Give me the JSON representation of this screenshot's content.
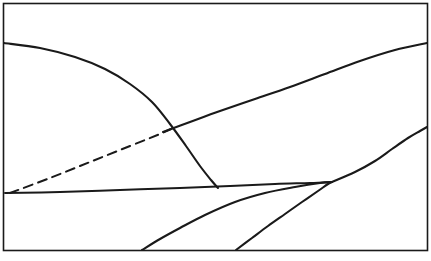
{
  "figure": {
    "title": "",
    "width": 431,
    "height": 261,
    "background_color": "#ffffff",
    "stroke_color": "#1a1a1a",
    "frame": {
      "name": "outer-rectangle-border",
      "x": 3.5,
      "y": 3.5,
      "width": 424,
      "height": 247,
      "stroke_width": 1.6,
      "fill": "none"
    }
  },
  "chart_data": {
    "type": "line",
    "title": "",
    "xlabel": "",
    "ylabel": "",
    "xlim": [
      0,
      431
    ],
    "ylim": [
      0,
      261
    ],
    "grid": false,
    "legend": "none",
    "note": "Schematic line diagram drawn in pixel coordinates; y increases downward.",
    "series": [
      {
        "name": "descending-curve",
        "style": "solid",
        "stroke_width": 2.1,
        "points": [
          [
            4,
            43
          ],
          [
            40,
            48
          ],
          [
            75,
            57
          ],
          [
            105,
            69
          ],
          [
            130,
            84
          ],
          [
            152,
            102
          ],
          [
            170,
            124
          ],
          [
            186,
            146
          ],
          [
            200,
            166
          ],
          [
            211,
            180
          ],
          [
            218,
            188
          ]
        ]
      },
      {
        "name": "upper-rising-curve",
        "style": "solid",
        "stroke_width": 2.1,
        "points": [
          [
            163,
            132
          ],
          [
            190,
            122
          ],
          [
            220,
            111
          ],
          [
            255,
            99
          ],
          [
            290,
            87
          ],
          [
            325,
            74
          ],
          [
            360,
            61
          ],
          [
            395,
            50
          ],
          [
            427,
            43
          ]
        ]
      },
      {
        "name": "near-horizontal-line",
        "style": "solid",
        "stroke_width": 2.0,
        "points": [
          [
            5,
            193
          ],
          [
            60,
            192
          ],
          [
            120,
            190
          ],
          [
            180,
            188
          ],
          [
            230,
            186
          ],
          [
            275,
            184
          ],
          [
            310,
            183
          ],
          [
            332,
            182
          ]
        ]
      },
      {
        "name": "lower-rising-curve",
        "style": "solid",
        "stroke_width": 2.1,
        "points": [
          [
            332,
            182
          ],
          [
            355,
            172
          ],
          [
            375,
            161
          ],
          [
            392,
            149
          ],
          [
            408,
            138
          ],
          [
            420,
            131
          ],
          [
            427,
            127
          ]
        ]
      },
      {
        "name": "left-bottom-branch",
        "style": "solid",
        "stroke_width": 2.1,
        "points": [
          [
            142,
            250
          ],
          [
            160,
            239
          ],
          [
            180,
            228
          ],
          [
            205,
            215
          ],
          [
            235,
            202
          ],
          [
            265,
            193
          ],
          [
            295,
            187
          ],
          [
            320,
            183
          ],
          [
            332,
            182
          ]
        ]
      },
      {
        "name": "right-bottom-branch",
        "style": "solid",
        "stroke_width": 2.1,
        "points": [
          [
            236,
            250
          ],
          [
            252,
            238
          ],
          [
            268,
            226
          ],
          [
            285,
            214
          ],
          [
            302,
            202
          ],
          [
            318,
            191
          ],
          [
            328,
            184
          ],
          [
            332,
            182
          ]
        ]
      },
      {
        "name": "dashed-line",
        "style": "dashed",
        "stroke_width": 2.0,
        "dash_pattern": "9 6",
        "points": [
          [
            10,
            193
          ],
          [
            50,
            178
          ],
          [
            90,
            162
          ],
          [
            130,
            146
          ],
          [
            160,
            134
          ],
          [
            173,
            128
          ]
        ]
      }
    ],
    "intersections": [
      {
        "name": "dashed-meets-curves",
        "x": 173,
        "y": 128
      },
      {
        "name": "descending-meets-horizontal",
        "x": 218,
        "y": 188
      },
      {
        "name": "branches-converge",
        "x": 332,
        "y": 182
      }
    ]
  }
}
